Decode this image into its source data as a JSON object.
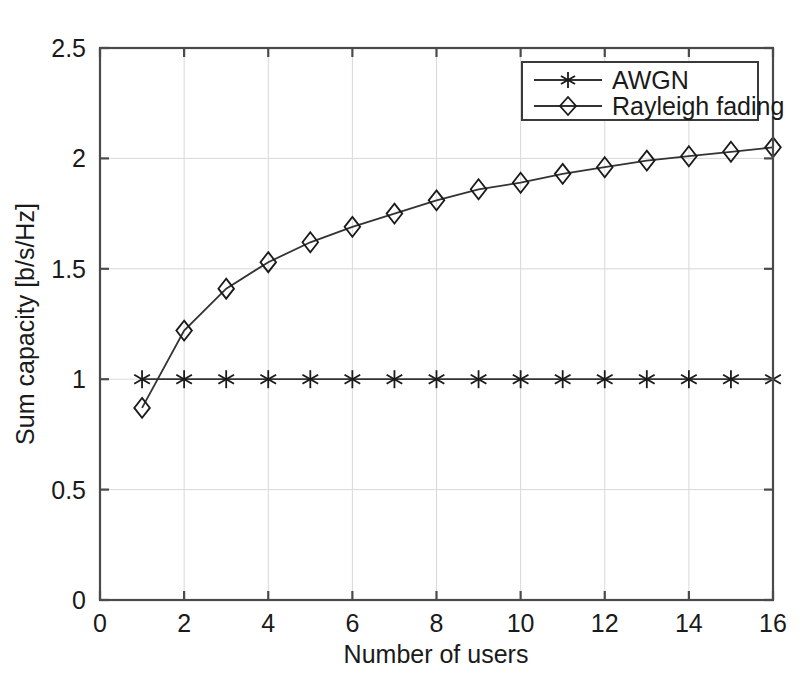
{
  "chart_data": {
    "type": "line",
    "title": "",
    "xlabel": "Number of users",
    "ylabel": "Sum capacity [b/s/Hz]",
    "xlim": [
      0,
      16
    ],
    "ylim": [
      0,
      2.5
    ],
    "xticks": [
      0,
      2,
      4,
      6,
      8,
      10,
      12,
      14,
      16
    ],
    "xtick_labels": [
      "0",
      "2",
      "4",
      "6",
      "8",
      "10",
      "12",
      "14",
      "16"
    ],
    "yticks": [
      0,
      0.5,
      1,
      1.5,
      2,
      2.5
    ],
    "ytick_labels": [
      "0",
      "0.5",
      "1",
      "1.5",
      "2",
      "2.5"
    ],
    "grid": true,
    "legend_position": "top-right",
    "x": [
      1,
      2,
      3,
      4,
      5,
      6,
      7,
      8,
      9,
      10,
      11,
      12,
      13,
      14,
      15,
      16
    ],
    "series": [
      {
        "name": "AWGN",
        "marker": "asterisk",
        "color": "#333333",
        "values": [
          1.0,
          1.0,
          1.0,
          1.0,
          1.0,
          1.0,
          1.0,
          1.0,
          1.0,
          1.0,
          1.0,
          1.0,
          1.0,
          1.0,
          1.0,
          1.0
        ]
      },
      {
        "name": "Rayleigh fading",
        "marker": "diamond",
        "color": "#333333",
        "values": [
          0.87,
          1.22,
          1.41,
          1.53,
          1.62,
          1.69,
          1.75,
          1.81,
          1.86,
          1.89,
          1.93,
          1.96,
          1.99,
          2.01,
          2.03,
          2.05
        ]
      }
    ]
  },
  "legend": {
    "entries": [
      {
        "label": "AWGN"
      },
      {
        "label": "Rayleigh fading"
      }
    ]
  }
}
